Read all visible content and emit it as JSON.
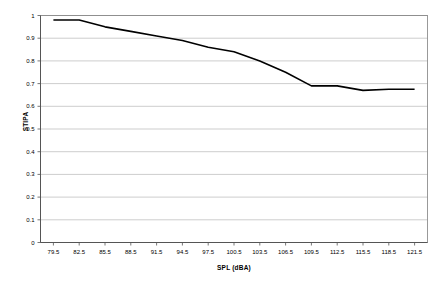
{
  "chart_data": {
    "type": "line",
    "title": "",
    "xlabel": "SPL (dBA)",
    "ylabel": "STIPA",
    "xlim": [
      78.0,
      123.0
    ],
    "ylim": [
      0,
      1
    ],
    "grid": true,
    "legend": false,
    "x_tick_labels": [
      "79.5",
      "82.5",
      "85.5",
      "88.5",
      "91.5",
      "94.5",
      "97.5",
      "100.5",
      "103.5",
      "106.5",
      "109.5",
      "112.5",
      "115.5",
      "118.5",
      "121.5"
    ],
    "y_tick_labels": [
      "0",
      "0.1",
      "0.2",
      "0.3",
      "0.4",
      "0.5",
      "0.6",
      "0.7",
      "0.8",
      "0.9",
      "1"
    ],
    "categories": [
      79.5,
      82.5,
      85.5,
      88.5,
      91.5,
      94.5,
      97.5,
      100.5,
      103.5,
      106.5,
      109.5,
      112.5,
      115.5,
      118.5,
      121.5
    ],
    "values": [
      0.98,
      0.98,
      0.95,
      0.93,
      0.91,
      0.89,
      0.86,
      0.84,
      0.8,
      0.75,
      0.69,
      0.69,
      0.67,
      0.675,
      0.675
    ],
    "series": [
      {
        "name": "STIPA",
        "color": "#000000",
        "line_width": 1.6,
        "values": [
          0.98,
          0.98,
          0.95,
          0.93,
          0.91,
          0.89,
          0.86,
          0.84,
          0.8,
          0.75,
          0.69,
          0.69,
          0.67,
          0.675,
          0.675
        ]
      }
    ]
  },
  "colors": {
    "line": "#000000",
    "grid": "#b8b8b8",
    "axis": "#808080",
    "text": "#000000",
    "background": "#ffffff"
  },
  "axes": {
    "y_title": "STIPA",
    "x_title": "SPL (dBA)"
  }
}
